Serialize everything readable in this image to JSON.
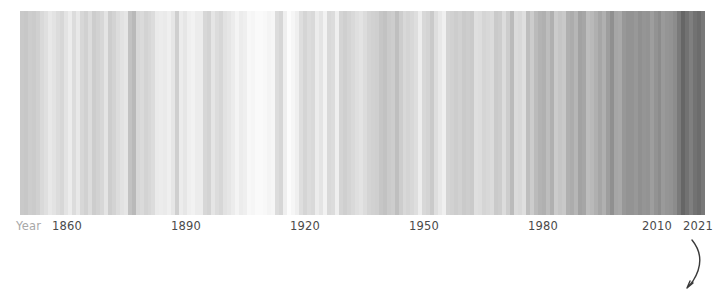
{
  "figure": {
    "kind": "warming-stripes",
    "background": "#ffffff",
    "axis_label_color": "#4a4a4a",
    "axis_name_color": "#a8a8a8"
  },
  "axis": {
    "name": "Year",
    "ticks": [
      {
        "label": "1860",
        "year": 1860,
        "x": 67
      },
      {
        "label": "1890",
        "year": 1890,
        "x": 186
      },
      {
        "label": "1920",
        "year": 1920,
        "x": 305
      },
      {
        "label": "1950",
        "year": 1950,
        "x": 424
      },
      {
        "label": "1980",
        "year": 1980,
        "x": 543
      },
      {
        "label": "2010",
        "year": 2010,
        "x": 657
      },
      {
        "label": "2021",
        "year": 2021,
        "x": 698
      }
    ]
  },
  "annotation": {
    "name": "hand-drawn-arc",
    "color": "#3a3a3a",
    "path": "M 27 7 C 36 18, 38 32, 28 48 C 26 51, 24 53, 22 55 M 22 55 L 28 50 M 22 55 L 25 48"
  },
  "chart_data": {
    "type": "bar",
    "title": "",
    "subtitle": "",
    "xlabel": "Year",
    "ylabel": "",
    "grid": false,
    "legend": null,
    "colormap": "grayscale (light = cool anomaly, dark = warm anomaly)",
    "xlim": [
      1850,
      2021
    ],
    "categories": [
      1850,
      1851,
      1852,
      1853,
      1854,
      1855,
      1856,
      1857,
      1858,
      1859,
      1860,
      1861,
      1862,
      1863,
      1864,
      1865,
      1866,
      1867,
      1868,
      1869,
      1870,
      1871,
      1872,
      1873,
      1874,
      1875,
      1876,
      1877,
      1878,
      1879,
      1880,
      1881,
      1882,
      1883,
      1884,
      1885,
      1886,
      1887,
      1888,
      1889,
      1890,
      1891,
      1892,
      1893,
      1894,
      1895,
      1896,
      1897,
      1898,
      1899,
      1900,
      1901,
      1902,
      1903,
      1904,
      1905,
      1906,
      1907,
      1908,
      1909,
      1910,
      1911,
      1912,
      1913,
      1914,
      1915,
      1916,
      1917,
      1918,
      1919,
      1920,
      1921,
      1922,
      1923,
      1924,
      1925,
      1926,
      1927,
      1928,
      1929,
      1930,
      1931,
      1932,
      1933,
      1934,
      1935,
      1936,
      1937,
      1938,
      1939,
      1940,
      1941,
      1942,
      1943,
      1944,
      1945,
      1946,
      1947,
      1948,
      1949,
      1950,
      1951,
      1952,
      1953,
      1954,
      1955,
      1956,
      1957,
      1958,
      1959,
      1960,
      1961,
      1962,
      1963,
      1964,
      1965,
      1966,
      1967,
      1968,
      1969,
      1970,
      1971,
      1972,
      1973,
      1974,
      1975,
      1976,
      1977,
      1978,
      1979,
      1980,
      1981,
      1982,
      1983,
      1984,
      1985,
      1986,
      1987,
      1988,
      1989,
      1990,
      1991,
      1992,
      1993,
      1994,
      1995,
      1996,
      1997,
      1998,
      1999,
      2000,
      2001,
      2002,
      2003,
      2004,
      2005,
      2006,
      2007,
      2008,
      2009,
      2010,
      2011,
      2012,
      2013,
      2014,
      2015,
      2016,
      2017,
      2018,
      2019,
      2020,
      2021
    ],
    "values": [
      0.82,
      0.83,
      0.8,
      0.81,
      0.78,
      0.72,
      0.68,
      0.62,
      0.66,
      0.7,
      0.73,
      0.66,
      0.58,
      0.7,
      0.62,
      0.72,
      0.76,
      0.7,
      0.78,
      0.75,
      0.72,
      0.65,
      0.78,
      0.74,
      0.68,
      0.64,
      0.62,
      0.85,
      0.9,
      0.72,
      0.7,
      0.74,
      0.72,
      0.68,
      0.6,
      0.58,
      0.6,
      0.56,
      0.62,
      0.76,
      0.58,
      0.62,
      0.56,
      0.54,
      0.58,
      0.58,
      0.72,
      0.74,
      0.64,
      0.7,
      0.72,
      0.66,
      0.62,
      0.58,
      0.52,
      0.58,
      0.56,
      0.48,
      0.5,
      0.46,
      0.46,
      0.48,
      0.52,
      0.5,
      0.66,
      0.7,
      0.56,
      0.44,
      0.5,
      0.56,
      0.6,
      0.66,
      0.62,
      0.64,
      0.58,
      0.62,
      0.54,
      0.64,
      0.62,
      0.56,
      0.68,
      0.72,
      0.68,
      0.64,
      0.6,
      0.58,
      0.62,
      0.68,
      0.7,
      0.72,
      0.78,
      0.8,
      0.76,
      0.74,
      0.82,
      0.74,
      0.66,
      0.68,
      0.66,
      0.62,
      0.54,
      0.68,
      0.7,
      0.76,
      0.62,
      0.56,
      0.5,
      0.7,
      0.72,
      0.74,
      0.72,
      0.76,
      0.74,
      0.76,
      0.58,
      0.6,
      0.68,
      0.66,
      0.64,
      0.76,
      0.74,
      0.62,
      0.74,
      0.84,
      0.64,
      0.66,
      0.6,
      0.82,
      0.74,
      0.84,
      0.88,
      0.9,
      0.8,
      0.9,
      0.74,
      0.78,
      0.76,
      0.9,
      0.92,
      0.86,
      0.96,
      0.94,
      0.8,
      0.82,
      0.88,
      0.94,
      0.88,
      0.98,
      1.06,
      0.94,
      0.92,
      1.0,
      1.04,
      1.04,
      1.0,
      1.06,
      1.02,
      1.04,
      0.96,
      1.04,
      1.08,
      0.98,
      1.02,
      1.04,
      1.08,
      1.16,
      1.24,
      1.18,
      1.12,
      1.18,
      1.22,
      1.14
    ],
    "stripe_colors": [
      "#c9c9c9",
      "#c7c7c7",
      "#cdcdcd",
      "#cbcbcb",
      "#d0d0d0",
      "#d9d9d9",
      "#dfdfdf",
      "#e8e8e8",
      "#e3e3e3",
      "#dcdcdc",
      "#d7d7d7",
      "#e3e3e3",
      "#ececec",
      "#dcdcdc",
      "#e8e8e8",
      "#d7d7d7",
      "#d1d1d1",
      "#dcdcdc",
      "#cdcdcd",
      "#d2d2d2",
      "#d7d7d7",
      "#e4e4e4",
      "#cdcdcd",
      "#d3d3d3",
      "#dcdcdc",
      "#e2e2e2",
      "#e6e6e6",
      "#c2c2c2",
      "#b9b9b9",
      "#d7d7d7",
      "#dadada",
      "#d3d3d3",
      "#d7d7d7",
      "#dcdcdc",
      "#eaeaea",
      "#ececec",
      "#eaeaea",
      "#efefef",
      "#e6e6e6",
      "#cfcfcf",
      "#ececec",
      "#e6e6e6",
      "#efefef",
      "#f2f2f2",
      "#ececec",
      "#ececec",
      "#d7d7d7",
      "#d3d3d3",
      "#e5e5e5",
      "#dcdcdc",
      "#d7d7d7",
      "#e2e2e2",
      "#e6e6e6",
      "#ececec",
      "#f4f4f4",
      "#ececec",
      "#efefef",
      "#f8f8f8",
      "#f6f6f6",
      "#fafafa",
      "#fafafa",
      "#f8f8f8",
      "#f4f4f4",
      "#f6f6f6",
      "#dcdcdc",
      "#d6d6d6",
      "#efefef",
      "#fcfcfc",
      "#f6f6f6",
      "#efefef",
      "#dedede",
      "#d5d5d5",
      "#dcdcdc",
      "#d9d9d9",
      "#ececec",
      "#e4e4e4",
      "#f2f2f2",
      "#d9d9d9",
      "#dcdcdc",
      "#efefef",
      "#d4d4d4",
      "#cfcfcf",
      "#d4d4d4",
      "#d9d9d9",
      "#dfdfdf",
      "#e3e3e3",
      "#dcdcdc",
      "#d4d4d4",
      "#d1d1d1",
      "#cfcfcf",
      "#c6c6c6",
      "#c2c2c2",
      "#cacaca",
      "#cdcdcd",
      "#bfbfbf",
      "#cdcdcd",
      "#d8d8d8",
      "#d4d4d4",
      "#d8d8d8",
      "#dedede",
      "#ededed",
      "#d8d8d8",
      "#d4d4d4",
      "#cacaca",
      "#dedede",
      "#e8e8e8",
      "#f0f0f0",
      "#d4d4d4",
      "#d1d1d1",
      "#cdcdcd",
      "#d1d1d1",
      "#cacaca",
      "#cdcdcd",
      "#cacaca",
      "#dfdfdf",
      "#dddddd",
      "#d5d5d5",
      "#d8d8d8",
      "#dbdbdb",
      "#cacaca",
      "#cdcdcd",
      "#dcdcdc",
      "#cdcdcd",
      "#bbbbbb",
      "#dbdbdb",
      "#d8d8d8",
      "#dfdfdf",
      "#bebebe",
      "#cccccc",
      "#bbbbbb",
      "#b3b3b3",
      "#b0b0b0",
      "#bdbdbd",
      "#b0b0b0",
      "#cbcbcb",
      "#c5c5c5",
      "#c9c9c9",
      "#b0b0b0",
      "#acacac",
      "#b6b6b6",
      "#a2a2a2",
      "#a6a6a6",
      "#bdbdbd",
      "#b9b9b9",
      "#b0b0b0",
      "#a6a6a6",
      "#b0b0b0",
      "#9e9e9e",
      "#909090",
      "#a6a6a6",
      "#a9a9a9",
      "#989898",
      "#939393",
      "#939393",
      "#989898",
      "#909090",
      "#959595",
      "#939393",
      "#9e9e9e",
      "#939393",
      "#8c8c8c",
      "#9a9a9a",
      "#959595",
      "#939393",
      "#8c8c8c",
      "#7a7a7a",
      "#666666",
      "#727272",
      "#7f7f7f",
      "#727272",
      "#6c6c6c",
      "#787878"
    ]
  }
}
